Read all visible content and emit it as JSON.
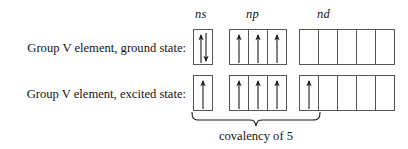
{
  "diagram": {
    "type": "orbital-box-diagram",
    "headers": [
      {
        "label": "ns",
        "style": "italic"
      },
      {
        "label": "np",
        "style": "italic"
      },
      {
        "label": "nd",
        "style": "italic"
      }
    ],
    "rows": [
      {
        "caption": "Group V element, ground state:",
        "groups": [
          {
            "sublevel": "ns",
            "boxes": 1,
            "electrons": [
              [
                "up",
                "down"
              ]
            ]
          },
          {
            "sublevel": "np",
            "boxes": 3,
            "electrons": [
              [
                "up"
              ],
              [
                "up"
              ],
              [
                "up"
              ]
            ]
          },
          {
            "sublevel": "nd",
            "boxes": 5,
            "electrons": [
              [],
              [],
              [],
              [],
              []
            ]
          }
        ]
      },
      {
        "caption": "Group V element, excited state:",
        "groups": [
          {
            "sublevel": "ns",
            "boxes": 1,
            "electrons": [
              [
                "up"
              ]
            ]
          },
          {
            "sublevel": "np",
            "boxes": 3,
            "electrons": [
              [
                "up"
              ],
              [
                "up"
              ],
              [
                "up"
              ]
            ]
          },
          {
            "sublevel": "nd",
            "boxes": 5,
            "electrons": [
              [
                "up"
              ],
              [],
              [],
              [],
              []
            ]
          }
        ]
      }
    ],
    "annotation": {
      "brace_caption": "covalency of 5",
      "brace_spans_orbitals": 5
    },
    "colors": {
      "background": "#ffffff",
      "ink": "#141414",
      "box_border": "#4a4a4a"
    }
  }
}
